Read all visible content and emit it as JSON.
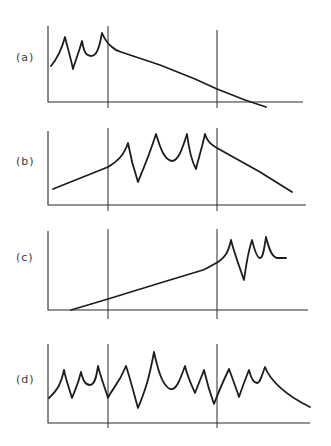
{
  "figure": {
    "panels": [
      {
        "id": "a",
        "label": "(a)",
        "label_pos": {
          "x": 16,
          "y": 51
        },
        "axis": {
          "x0": 48,
          "y_top": 26,
          "y_base": 102,
          "x_end": 303
        },
        "dividers": [
          {
            "x": 108,
            "y1": 26,
            "y2": 108
          },
          {
            "x": 217,
            "y1": 30,
            "y2": 108
          }
        ],
        "curve": "M51,66 C56,60 61,52 65,37 C67,46 70,55 73,69 C75,62 78,55 82,41 C84,52 86,56 91,56 C96,56 99,50 102,33 C105,40 108,44 112,47 C115,50 117,51 121,52 L160,65 L195,79 L217,89 L245,100 L266,107"
      },
      {
        "id": "b",
        "label": "(b)",
        "label_pos": {
          "x": 16,
          "y": 155
        },
        "axis": {
          "x0": 48,
          "y_top": 131,
          "y_base": 205,
          "x_end": 306
        },
        "dividers": [
          {
            "x": 108,
            "y1": 128,
            "y2": 211
          },
          {
            "x": 217,
            "y1": 128,
            "y2": 211
          }
        ],
        "curve": "M53,189 L108,167 C118,161 124,155 128,143 C131,160 134,170 138,182 C145,165 150,153 156,134 C160,147 164,160 172,161 C178,161 182,150 187,134 C189,150 191,160 196,169 C198,160 201,152 205,134 C207,142 212,145 217,148 L260,172 L292,192"
      },
      {
        "id": "c",
        "label": "(c)",
        "label_pos": {
          "x": 16,
          "y": 251
        },
        "axis": {
          "x0": 48,
          "y_top": 231,
          "y_base": 310,
          "x_end": 308
        },
        "dividers": [
          {
            "x": 108,
            "y1": 229,
            "y2": 319
          },
          {
            "x": 217,
            "y1": 229,
            "y2": 319
          }
        ],
        "curve": "M71,310 L108,299 L160,283 L203,270 C210,267 214,264 218,262 C224,258 228,254 231,240 C234,252 238,263 244,280 C246,265 248,252 252,240 C254,248 257,258 260,258 C263,258 264,250 266,237 C268,245 271,257 277,258 L286,258"
      },
      {
        "id": "d",
        "label": "(d)",
        "label_pos": {
          "x": 16,
          "y": 373
        },
        "axis": {
          "x0": 48,
          "y_top": 344,
          "y_base": 423,
          "x_end": 310
        },
        "dividers": [
          {
            "x": 108,
            "y1": 344,
            "y2": 428
          },
          {
            "x": 217,
            "y1": 344,
            "y2": 428
          }
        ],
        "curve": "M49,398 C55,392 60,388 64,370 C66,380 69,388 72,398 C75,390 78,385 81,372 C83,380 85,385 90,385 C94,385 96,380 98,366 C101,378 104,385 108,398 C111,390 118,386 126,366 C130,378 133,390 138,408 C143,395 148,385 154,352 C158,370 162,385 170,389 C176,391 180,380 185,366 C187,375 190,382 195,393 C198,385 201,378 204,370 C207,383 210,393 214,404 C217,396 220,388 229,369 C233,380 236,388 239,397 C242,388 245,380 249,370 C251,378 253,383 257,383 C260,383 262,375 265,367 C270,380 285,395 310,407"
      }
    ]
  }
}
